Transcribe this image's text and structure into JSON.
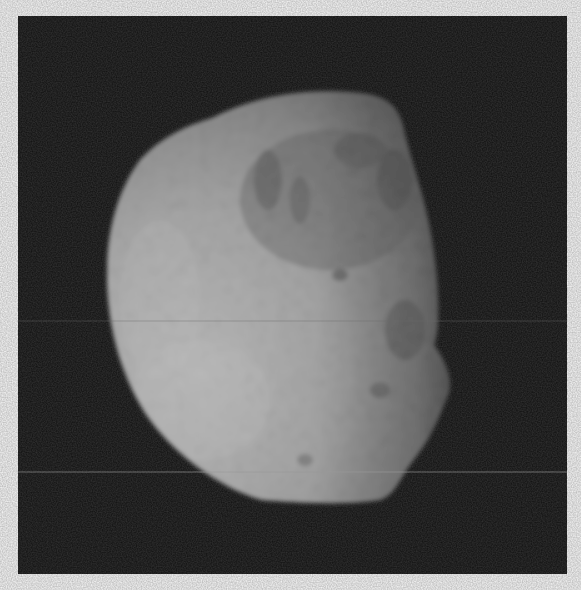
{
  "image": {
    "subject": "irregular moon",
    "style": "grayscale spacecraft photograph",
    "background_color": "#0c0c0c",
    "border_color": "#ffffff",
    "surface_light": "#d8d8d8",
    "surface_dark": "#5a5a5a",
    "scan_lines_y": [
      321,
      472
    ]
  }
}
